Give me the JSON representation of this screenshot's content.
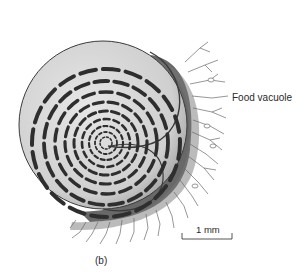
{
  "figure": {
    "panel_label": "(b)",
    "labels": {
      "food_vacuole": "Food vacuole"
    },
    "scale_bar": {
      "label": "1 mm"
    },
    "colors": {
      "background": "#ffffff",
      "shell_fill": "#d9d9d9",
      "shell_outline": "#3a3a3a",
      "chamber_slot": "#2e2e2e",
      "pseudopodia_halo": "#555555",
      "pseudopodia_lines": "#6a6a6a",
      "text": "#2a2a2a"
    }
  }
}
